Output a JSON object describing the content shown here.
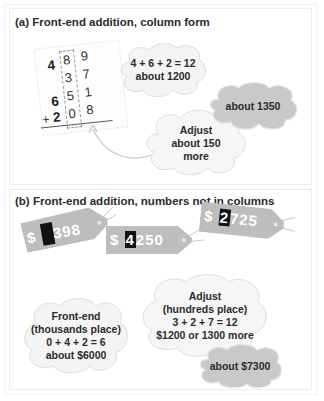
{
  "colors": {
    "cloud_light": "#f4f4f4",
    "cloud_dark": "#c9c9c9",
    "cloud_border": "#d6d6d6",
    "tag_fill": "#bdbdbd",
    "hide_box": "#111111",
    "text": "#2a2a2a"
  },
  "panel_a": {
    "title": "(a)  Front-end addition, column form",
    "column_addition": {
      "rows": [
        {
          "thousands": "4",
          "hundreds": "8",
          "tens": "9"
        },
        {
          "thousands": "",
          "hundreds": "3",
          "tens": "7"
        },
        {
          "thousands": "6",
          "hundreds": "5",
          "tens": "1"
        },
        {
          "thousands": "2",
          "hundreds": "0",
          "tens": "8",
          "operator": "+"
        }
      ]
    },
    "cloud_front_end": {
      "line1": "4 + 6 + 2 = 12",
      "line2": "about 1200"
    },
    "cloud_adjust": {
      "line1": "Adjust",
      "line2": "about 150",
      "line3": "more"
    },
    "cloud_result": {
      "line1": "about 1350"
    }
  },
  "panel_b": {
    "title": "(b)  Front-end addition, numbers not in columns",
    "tags": [
      {
        "currency": "$",
        "hidden_digit": "",
        "rest": "398"
      },
      {
        "currency": "$",
        "hidden_digit": "4",
        "rest": "250"
      },
      {
        "currency": "$",
        "hidden_digit": "2",
        "rest": "725"
      }
    ],
    "cloud_front_end": {
      "line1": "Front-end",
      "line2": "(thousands place)",
      "line3": "0 + 4 + 2 = 6",
      "line4": "about $6000"
    },
    "cloud_adjust": {
      "line1": "Adjust",
      "line2": "(hundreds place)",
      "line3": "3 + 2 + 7 = 12",
      "line4": "$1200 or 1300 more"
    },
    "cloud_result": {
      "line1": "about $7300"
    }
  }
}
